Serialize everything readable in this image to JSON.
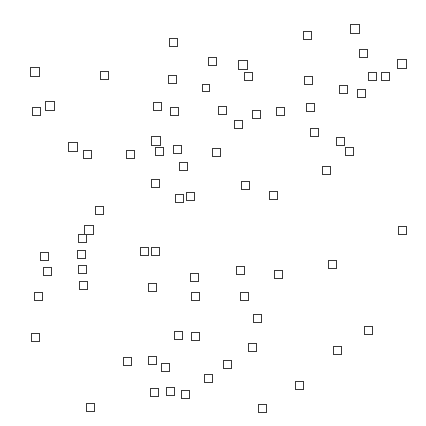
{
  "canvas": {
    "width": 426,
    "height": 426,
    "background_color": "#ffffff",
    "marker_shape": "square-outline",
    "marker_stroke_color": "#3a3a3a",
    "marker_fill_color": "transparent",
    "marker_stroke_width": 1.5,
    "marker_count": 88
  },
  "chart_data": {
    "type": "scatter",
    "title": "",
    "subtitle": "",
    "xlabel": "",
    "ylabel": "",
    "xlim": [
      0,
      426
    ],
    "ylim": [
      0,
      426
    ],
    "grid": false,
    "axes_visible": false,
    "tick_labels_x": [],
    "tick_labels_y": [],
    "legend": [],
    "annotations": [],
    "series": [
      {
        "name": "squares",
        "marker": "square-outline",
        "color": "#3a3a3a",
        "points": [
          {
            "x": 169,
            "y": 38,
            "s": 9
          },
          {
            "x": 303,
            "y": 31,
            "s": 9
          },
          {
            "x": 350,
            "y": 24,
            "s": 10
          },
          {
            "x": 30,
            "y": 67,
            "s": 10
          },
          {
            "x": 100,
            "y": 71,
            "s": 9
          },
          {
            "x": 208,
            "y": 57,
            "s": 9
          },
          {
            "x": 238,
            "y": 60,
            "s": 10
          },
          {
            "x": 359,
            "y": 49,
            "s": 9
          },
          {
            "x": 168,
            "y": 75,
            "s": 9
          },
          {
            "x": 202,
            "y": 84,
            "s": 8
          },
          {
            "x": 244,
            "y": 72,
            "s": 9
          },
          {
            "x": 304,
            "y": 76,
            "s": 9
          },
          {
            "x": 397,
            "y": 59,
            "s": 10
          },
          {
            "x": 368,
            "y": 72,
            "s": 9
          },
          {
            "x": 381,
            "y": 72,
            "s": 9
          },
          {
            "x": 32,
            "y": 107,
            "s": 9
          },
          {
            "x": 45,
            "y": 101,
            "s": 10
          },
          {
            "x": 153,
            "y": 102,
            "s": 9
          },
          {
            "x": 170,
            "y": 107,
            "s": 9
          },
          {
            "x": 218,
            "y": 106,
            "s": 9
          },
          {
            "x": 252,
            "y": 110,
            "s": 9
          },
          {
            "x": 276,
            "y": 107,
            "s": 9
          },
          {
            "x": 339,
            "y": 85,
            "s": 9
          },
          {
            "x": 357,
            "y": 89,
            "s": 9
          },
          {
            "x": 306,
            "y": 103,
            "s": 9
          },
          {
            "x": 234,
            "y": 120,
            "s": 9
          },
          {
            "x": 68,
            "y": 142,
            "s": 10
          },
          {
            "x": 83,
            "y": 150,
            "s": 9
          },
          {
            "x": 151,
            "y": 136,
            "s": 10
          },
          {
            "x": 310,
            "y": 128,
            "s": 9
          },
          {
            "x": 336,
            "y": 137,
            "s": 9
          },
          {
            "x": 155,
            "y": 147,
            "s": 9
          },
          {
            "x": 126,
            "y": 150,
            "s": 9
          },
          {
            "x": 173,
            "y": 145,
            "s": 9
          },
          {
            "x": 212,
            "y": 148,
            "s": 9
          },
          {
            "x": 345,
            "y": 147,
            "s": 9
          },
          {
            "x": 179,
            "y": 162,
            "s": 9
          },
          {
            "x": 322,
            "y": 166,
            "s": 9
          },
          {
            "x": 151,
            "y": 179,
            "s": 9
          },
          {
            "x": 241,
            "y": 181,
            "s": 9
          },
          {
            "x": 269,
            "y": 191,
            "s": 9
          },
          {
            "x": 175,
            "y": 194,
            "s": 9
          },
          {
            "x": 186,
            "y": 192,
            "s": 9
          },
          {
            "x": 95,
            "y": 206,
            "s": 9
          },
          {
            "x": 398,
            "y": 226,
            "s": 9
          },
          {
            "x": 84,
            "y": 225,
            "s": 10
          },
          {
            "x": 78,
            "y": 234,
            "s": 9
          },
          {
            "x": 40,
            "y": 252,
            "s": 9
          },
          {
            "x": 77,
            "y": 250,
            "s": 9
          },
          {
            "x": 140,
            "y": 247,
            "s": 9
          },
          {
            "x": 151,
            "y": 247,
            "s": 9
          },
          {
            "x": 328,
            "y": 260,
            "s": 9
          },
          {
            "x": 43,
            "y": 267,
            "s": 9
          },
          {
            "x": 78,
            "y": 265,
            "s": 9
          },
          {
            "x": 236,
            "y": 266,
            "s": 9
          },
          {
            "x": 190,
            "y": 273,
            "s": 9
          },
          {
            "x": 274,
            "y": 270,
            "s": 9
          },
          {
            "x": 79,
            "y": 281,
            "s": 9
          },
          {
            "x": 34,
            "y": 292,
            "s": 9
          },
          {
            "x": 148,
            "y": 283,
            "s": 9
          },
          {
            "x": 191,
            "y": 292,
            "s": 9
          },
          {
            "x": 240,
            "y": 292,
            "s": 9
          },
          {
            "x": 253,
            "y": 314,
            "s": 9
          },
          {
            "x": 31,
            "y": 333,
            "s": 9
          },
          {
            "x": 174,
            "y": 331,
            "s": 9
          },
          {
            "x": 191,
            "y": 332,
            "s": 9
          },
          {
            "x": 248,
            "y": 343,
            "s": 9
          },
          {
            "x": 364,
            "y": 326,
            "s": 9
          },
          {
            "x": 123,
            "y": 357,
            "s": 9
          },
          {
            "x": 148,
            "y": 356,
            "s": 9
          },
          {
            "x": 161,
            "y": 363,
            "s": 9
          },
          {
            "x": 223,
            "y": 360,
            "s": 9
          },
          {
            "x": 333,
            "y": 346,
            "s": 9
          },
          {
            "x": 204,
            "y": 374,
            "s": 9
          },
          {
            "x": 150,
            "y": 388,
            "s": 9
          },
          {
            "x": 166,
            "y": 387,
            "s": 9
          },
          {
            "x": 181,
            "y": 390,
            "s": 9
          },
          {
            "x": 295,
            "y": 381,
            "s": 9
          },
          {
            "x": 86,
            "y": 403,
            "s": 9
          },
          {
            "x": 258,
            "y": 404,
            "s": 9
          }
        ]
      }
    ]
  }
}
